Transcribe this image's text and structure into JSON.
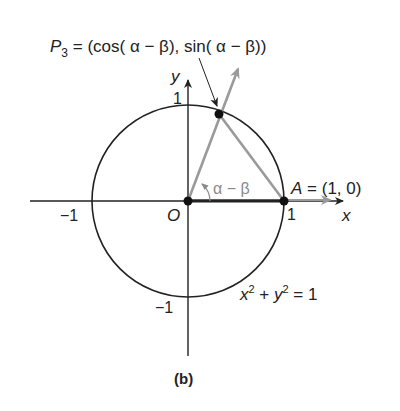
{
  "figure": {
    "caption": "(b)",
    "point_p3": {
      "name": "P",
      "subscript": "3",
      "label": " = (cos( α − β), sin( α − β))"
    },
    "point_a": {
      "label": "A = (1, 0)"
    },
    "origin_label": "O",
    "angle_label": "α − β",
    "axis_x_label": "x",
    "axis_y_label": "y",
    "ticks": {
      "x_pos": "1",
      "x_neg": "−1",
      "y_pos": "1",
      "y_neg": "−1"
    },
    "equation": {
      "x": "x",
      "x_exp": "2",
      "plus": " + ",
      "y": "y",
      "y_exp": "2",
      "rhs": " = 1"
    }
  },
  "colors": {
    "ink": "#222222",
    "gray_ray": "#9a9a9a"
  }
}
